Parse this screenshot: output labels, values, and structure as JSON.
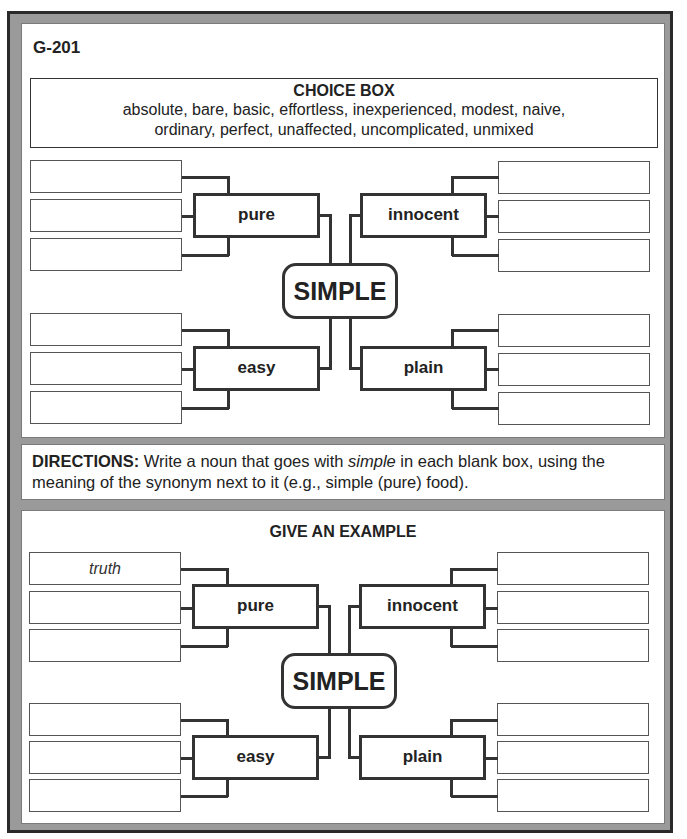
{
  "worksheet_code": "G-201",
  "choice_box": {
    "title": "CHOICE BOX",
    "words_line1": "absolute, bare, basic, effortless, inexperienced, modest, naive,",
    "words_line2": "ordinary, perfect, unaffected, uncomplicated, unmixed",
    "words": [
      "absolute",
      "bare",
      "basic",
      "effortless",
      "inexperienced",
      "modest",
      "naive",
      "ordinary",
      "perfect",
      "unaffected",
      "uncomplicated",
      "unmixed"
    ]
  },
  "web1": {
    "center": "SIMPLE",
    "synonyms": {
      "top_left": "pure",
      "top_right": "innocent",
      "bottom_left": "easy",
      "bottom_right": "plain"
    },
    "blanks": {
      "top_left": [
        "",
        "",
        ""
      ],
      "top_right": [
        "",
        "",
        ""
      ],
      "bottom_left": [
        "",
        "",
        ""
      ],
      "bottom_right": [
        "",
        "",
        ""
      ]
    }
  },
  "directions": {
    "label": "DIRECTIONS:",
    "text_before": " Write a noun that goes with ",
    "italic_word": "simple",
    "text_after": " in each blank box, using the meaning of the synonym next to it (e.g., simple (pure) food)."
  },
  "web2": {
    "title": "GIVE AN EXAMPLE",
    "center": "SIMPLE",
    "synonyms": {
      "top_left": "pure",
      "top_right": "innocent",
      "bottom_left": "easy",
      "bottom_right": "plain"
    },
    "blanks": {
      "top_left": [
        "truth",
        "",
        ""
      ],
      "top_right": [
        "",
        "",
        ""
      ],
      "bottom_left": [
        "",
        "",
        ""
      ],
      "bottom_right": [
        "",
        "",
        ""
      ]
    }
  }
}
